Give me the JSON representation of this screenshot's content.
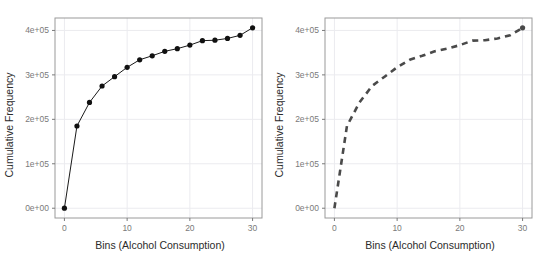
{
  "figure": {
    "background_color": "#ffffff",
    "panel_border_color": "#9a9a9a",
    "grid_color": "#ebebef",
    "tick_color": "#7a7a7a",
    "panel_count": 2
  },
  "chart_data": [
    {
      "type": "line",
      "id": "left-panel",
      "title": "",
      "xlabel": "Bins (Alcohol Consumption)",
      "ylabel": "Cumulative Frequency",
      "x": [
        0,
        2,
        4,
        6,
        8,
        10,
        12,
        14,
        16,
        18,
        20,
        22,
        24,
        26,
        28,
        30
      ],
      "values": [
        0,
        185000,
        238000,
        275000,
        296000,
        317000,
        334000,
        343000,
        353000,
        359000,
        367000,
        377000,
        378000,
        382000,
        389000,
        406000
      ],
      "xlim": [
        -1.5,
        31.5
      ],
      "ylim": [
        -22000,
        428000
      ],
      "xticks": [
        0,
        10,
        20,
        30
      ],
      "xticklabels": [
        "0",
        "10",
        "20",
        "30"
      ],
      "yticks": [
        0,
        100000,
        200000,
        300000,
        400000
      ],
      "yticklabels": [
        "0e+00",
        "1e+05",
        "2e+05",
        "3e+05",
        "4e+05"
      ],
      "grid": true,
      "legend": "none",
      "line_style": "solid",
      "line_color": "#1a1a1a",
      "line_width": 1,
      "marker": "filled-circle",
      "marker_color": "#111111",
      "marker_size": 2.6
    },
    {
      "type": "line",
      "id": "right-panel",
      "title": "",
      "xlabel": "Bins (Alcohol Consumption)",
      "ylabel": "Cumulative Frequency",
      "x": [
        0,
        2,
        4,
        6,
        8,
        10,
        12,
        14,
        16,
        18,
        20,
        22,
        24,
        26,
        28,
        30
      ],
      "values": [
        0,
        185000,
        238000,
        275000,
        296000,
        317000,
        334000,
        343000,
        353000,
        359000,
        367000,
        377000,
        378000,
        382000,
        389000,
        406000
      ],
      "xlim": [
        -1.5,
        31.5
      ],
      "ylim": [
        -22000,
        428000
      ],
      "xticks": [
        0,
        10,
        20,
        30
      ],
      "xticklabels": [
        "0",
        "10",
        "20",
        "30"
      ],
      "yticks": [
        0,
        100000,
        200000,
        300000,
        400000
      ],
      "yticklabels": [
        "0e+00",
        "1e+05",
        "2e+05",
        "3e+05",
        "4e+05"
      ],
      "grid": true,
      "legend": "none",
      "line_style": "dashed",
      "line_color": "#4a4a4a",
      "line_width": 2.6,
      "dash_pattern": "6,5",
      "marker": "none",
      "endpoint_marker": "filled-circle",
      "endpoint_marker_color": "#4a4a4a",
      "endpoint_marker_size": 2.6
    }
  ]
}
